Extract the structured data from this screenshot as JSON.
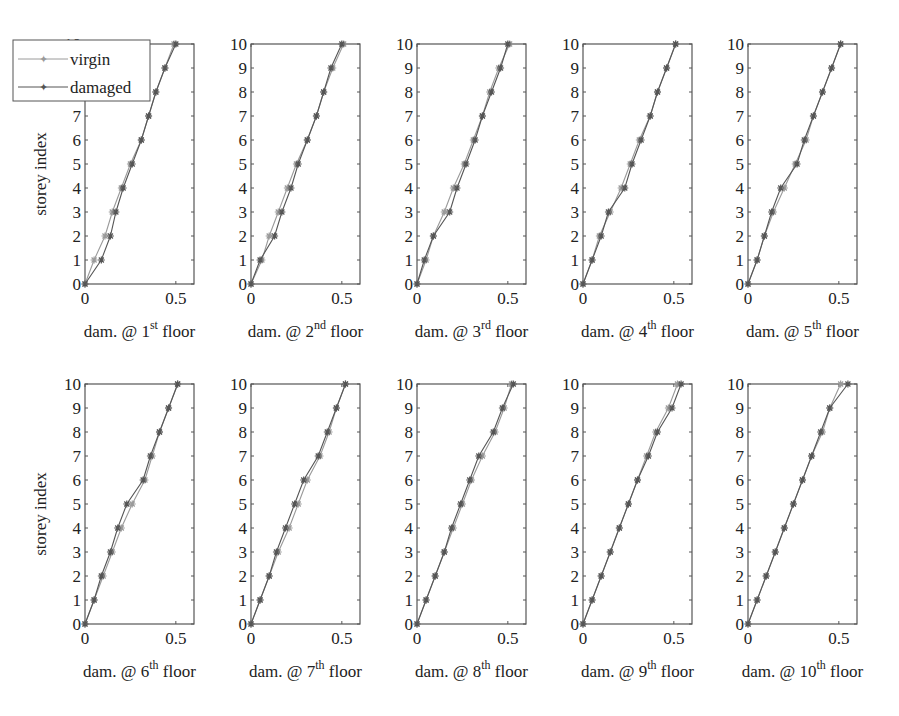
{
  "figure": {
    "ylabel": "storey index",
    "legend": [
      {
        "label": "virgin",
        "color": "#9a9a9a"
      },
      {
        "label": "damaged",
        "color": "#555555"
      }
    ]
  },
  "chart_data": [
    {
      "type": "line",
      "title": "",
      "xlabel": "dam. @ 1st floor",
      "xlabel_base": "dam. @ 1",
      "xlabel_sup": "st",
      "xlabel_tail": " floor",
      "ylabel": "storey index",
      "xlim": [
        0,
        0.6
      ],
      "ylim": [
        0,
        10
      ],
      "xticks": [
        "0",
        "0.5"
      ],
      "yticks": [
        "0",
        "1",
        "2",
        "3",
        "4",
        "5",
        "6",
        "7",
        "8",
        "9",
        "10"
      ],
      "legend": [
        "virgin",
        "damaged"
      ],
      "x": [
        0,
        1,
        2,
        3,
        4,
        5,
        6,
        7,
        8,
        9,
        10
      ],
      "series": [
        {
          "name": "virgin",
          "values": [
            0,
            0.05,
            0.11,
            0.15,
            0.2,
            0.25,
            0.31,
            0.35,
            0.39,
            0.44,
            0.49
          ]
        },
        {
          "name": "damaged",
          "values": [
            0,
            0.09,
            0.14,
            0.17,
            0.21,
            0.26,
            0.31,
            0.35,
            0.39,
            0.44,
            0.5
          ]
        }
      ]
    },
    {
      "type": "line",
      "title": "",
      "xlabel": "dam. @ 2nd floor",
      "xlabel_base": "dam. @ 2",
      "xlabel_sup": "nd",
      "xlabel_tail": " floor",
      "xlim": [
        0,
        0.6
      ],
      "ylim": [
        0,
        10
      ],
      "xticks": [
        "0",
        "0.5"
      ],
      "yticks": [
        "0",
        "1",
        "2",
        "3",
        "4",
        "5",
        "6",
        "7",
        "8",
        "9",
        "10"
      ],
      "x": [
        0,
        1,
        2,
        3,
        4,
        5,
        6,
        7,
        8,
        9,
        10
      ],
      "series": [
        {
          "name": "virgin",
          "values": [
            0,
            0.06,
            0.1,
            0.15,
            0.2,
            0.25,
            0.31,
            0.36,
            0.4,
            0.45,
            0.51
          ]
        },
        {
          "name": "damaged",
          "values": [
            0,
            0.05,
            0.13,
            0.17,
            0.22,
            0.26,
            0.31,
            0.36,
            0.4,
            0.44,
            0.5
          ]
        }
      ]
    },
    {
      "type": "line",
      "title": "",
      "xlabel": "dam. @ 3rd floor",
      "xlabel_base": "dam. @ 3",
      "xlabel_sup": "rd",
      "xlabel_tail": " floor",
      "xlim": [
        0,
        0.6
      ],
      "ylim": [
        0,
        10
      ],
      "xticks": [
        "0",
        "0.5"
      ],
      "yticks": [
        "0",
        "1",
        "2",
        "3",
        "4",
        "5",
        "6",
        "7",
        "8",
        "9",
        "10"
      ],
      "x": [
        0,
        1,
        2,
        3,
        4,
        5,
        6,
        7,
        8,
        9,
        10
      ],
      "series": [
        {
          "name": "virgin",
          "values": [
            0,
            0.05,
            0.09,
            0.15,
            0.2,
            0.26,
            0.31,
            0.36,
            0.4,
            0.45,
            0.51
          ]
        },
        {
          "name": "damaged",
          "values": [
            0,
            0.04,
            0.09,
            0.18,
            0.22,
            0.27,
            0.32,
            0.36,
            0.41,
            0.46,
            0.5
          ]
        }
      ]
    },
    {
      "type": "line",
      "title": "",
      "xlabel": "dam. @ 4th floor",
      "xlabel_base": "dam. @ 4",
      "xlabel_sup": "th",
      "xlabel_tail": " floor",
      "xlim": [
        0,
        0.6
      ],
      "ylim": [
        0,
        10
      ],
      "xticks": [
        "0",
        "0.5"
      ],
      "yticks": [
        "0",
        "1",
        "2",
        "3",
        "4",
        "5",
        "6",
        "7",
        "8",
        "9",
        "10"
      ],
      "x": [
        0,
        1,
        2,
        3,
        4,
        5,
        6,
        7,
        8,
        9,
        10
      ],
      "series": [
        {
          "name": "virgin",
          "values": [
            0,
            0.05,
            0.09,
            0.15,
            0.21,
            0.26,
            0.31,
            0.37,
            0.41,
            0.46,
            0.51
          ]
        },
        {
          "name": "damaged",
          "values": [
            0,
            0.05,
            0.1,
            0.14,
            0.23,
            0.27,
            0.32,
            0.37,
            0.41,
            0.46,
            0.51
          ]
        }
      ]
    },
    {
      "type": "line",
      "title": "",
      "xlabel": "dam. @ 5th floor",
      "xlabel_base": "dam. @ 5",
      "xlabel_sup": "th",
      "xlabel_tail": " floor",
      "xlim": [
        0,
        0.6
      ],
      "ylim": [
        0,
        10
      ],
      "xticks": [
        "0",
        "0.5"
      ],
      "yticks": [
        "0",
        "1",
        "2",
        "3",
        "4",
        "5",
        "6",
        "7",
        "8",
        "9",
        "10"
      ],
      "x": [
        0,
        1,
        2,
        3,
        4,
        5,
        6,
        7,
        8,
        9,
        10
      ],
      "series": [
        {
          "name": "virgin",
          "values": [
            0,
            0.05,
            0.09,
            0.14,
            0.2,
            0.26,
            0.32,
            0.36,
            0.41,
            0.46,
            0.51
          ]
        },
        {
          "name": "damaged",
          "values": [
            0,
            0.05,
            0.09,
            0.13,
            0.18,
            0.27,
            0.31,
            0.36,
            0.41,
            0.46,
            0.51
          ]
        }
      ]
    },
    {
      "type": "line",
      "title": "",
      "xlabel": "dam. @ 6th floor",
      "xlabel_base": "dam. @ 6",
      "xlabel_sup": "th",
      "xlabel_tail": " floor",
      "ylabel": "storey index",
      "xlim": [
        0,
        0.6
      ],
      "ylim": [
        0,
        10
      ],
      "xticks": [
        "0",
        "0.5"
      ],
      "yticks": [
        "0",
        "1",
        "2",
        "3",
        "4",
        "5",
        "6",
        "7",
        "8",
        "9",
        "10"
      ],
      "x": [
        0,
        1,
        2,
        3,
        4,
        5,
        6,
        7,
        8,
        9,
        10
      ],
      "series": [
        {
          "name": "virgin",
          "values": [
            0,
            0.05,
            0.1,
            0.15,
            0.2,
            0.26,
            0.33,
            0.37,
            0.41,
            0.46,
            0.51
          ]
        },
        {
          "name": "damaged",
          "values": [
            0,
            0.05,
            0.09,
            0.14,
            0.18,
            0.23,
            0.32,
            0.36,
            0.41,
            0.46,
            0.51
          ]
        }
      ]
    },
    {
      "type": "line",
      "title": "",
      "xlabel": "dam. @ 7th floor",
      "xlabel_base": "dam. @ 7",
      "xlabel_sup": "th",
      "xlabel_tail": " floor",
      "xlim": [
        0,
        0.6
      ],
      "ylim": [
        0,
        10
      ],
      "xticks": [
        "0",
        "0.5"
      ],
      "yticks": [
        "0",
        "1",
        "2",
        "3",
        "4",
        "5",
        "6",
        "7",
        "8",
        "9",
        "10"
      ],
      "x": [
        0,
        1,
        2,
        3,
        4,
        5,
        6,
        7,
        8,
        9,
        10
      ],
      "series": [
        {
          "name": "virgin",
          "values": [
            0,
            0.05,
            0.1,
            0.15,
            0.21,
            0.26,
            0.31,
            0.38,
            0.43,
            0.47,
            0.52
          ]
        },
        {
          "name": "damaged",
          "values": [
            0,
            0.05,
            0.1,
            0.14,
            0.19,
            0.24,
            0.29,
            0.37,
            0.42,
            0.47,
            0.52
          ]
        }
      ]
    },
    {
      "type": "line",
      "title": "",
      "xlabel": "dam. @ 8th floor",
      "xlabel_base": "dam. @ 8",
      "xlabel_sup": "th",
      "xlabel_tail": " floor",
      "xlim": [
        0,
        0.6
      ],
      "ylim": [
        0,
        10
      ],
      "xticks": [
        "0",
        "0.5"
      ],
      "yticks": [
        "0",
        "1",
        "2",
        "3",
        "4",
        "5",
        "6",
        "7",
        "8",
        "9",
        "10"
      ],
      "x": [
        0,
        1,
        2,
        3,
        4,
        5,
        6,
        7,
        8,
        9,
        10
      ],
      "series": [
        {
          "name": "virgin",
          "values": [
            0,
            0.05,
            0.1,
            0.15,
            0.2,
            0.25,
            0.3,
            0.36,
            0.43,
            0.48,
            0.52
          ]
        },
        {
          "name": "damaged",
          "values": [
            0,
            0.05,
            0.1,
            0.15,
            0.19,
            0.24,
            0.29,
            0.34,
            0.42,
            0.47,
            0.53
          ]
        }
      ]
    },
    {
      "type": "line",
      "title": "",
      "xlabel": "dam. @ 9th floor",
      "xlabel_base": "dam. @ 9",
      "xlabel_sup": "th",
      "xlabel_tail": " floor",
      "xlim": [
        0,
        0.6
      ],
      "ylim": [
        0,
        10
      ],
      "xticks": [
        "0",
        "0.5"
      ],
      "yticks": [
        "0",
        "1",
        "2",
        "3",
        "4",
        "5",
        "6",
        "7",
        "8",
        "9",
        "10"
      ],
      "x": [
        0,
        1,
        2,
        3,
        4,
        5,
        6,
        7,
        8,
        9,
        10
      ],
      "series": [
        {
          "name": "virgin",
          "values": [
            0,
            0.05,
            0.1,
            0.15,
            0.2,
            0.25,
            0.3,
            0.35,
            0.4,
            0.47,
            0.52
          ]
        },
        {
          "name": "damaged",
          "values": [
            0,
            0.05,
            0.1,
            0.15,
            0.2,
            0.25,
            0.3,
            0.36,
            0.41,
            0.49,
            0.54
          ]
        }
      ]
    },
    {
      "type": "line",
      "title": "",
      "xlabel": "dam. @ 10th floor",
      "xlabel_base": "dam. @ 10",
      "xlabel_sup": "th",
      "xlabel_tail": " floor",
      "xlim": [
        0,
        0.6
      ],
      "ylim": [
        0,
        10
      ],
      "xticks": [
        "0",
        "0.5"
      ],
      "yticks": [
        "0",
        "1",
        "2",
        "3",
        "4",
        "5",
        "6",
        "7",
        "8",
        "9",
        "10"
      ],
      "x": [
        0,
        1,
        2,
        3,
        4,
        5,
        6,
        7,
        8,
        9,
        10
      ],
      "series": [
        {
          "name": "virgin",
          "values": [
            0,
            0.05,
            0.1,
            0.15,
            0.2,
            0.25,
            0.3,
            0.35,
            0.41,
            0.45,
            0.51
          ]
        },
        {
          "name": "damaged",
          "values": [
            0,
            0.05,
            0.1,
            0.15,
            0.2,
            0.25,
            0.3,
            0.35,
            0.4,
            0.45,
            0.55
          ]
        }
      ]
    }
  ]
}
